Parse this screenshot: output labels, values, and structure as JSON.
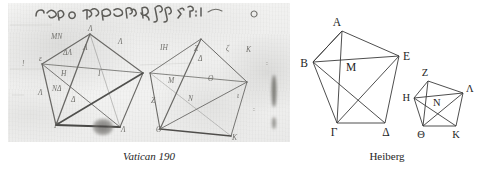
{
  "figure": {
    "panels": [
      {
        "id": "vatican",
        "caption": "Vatican 190",
        "caption_style": "italic",
        "kind": "manuscript-facsimile",
        "description": "Greek manuscript diagram: two overlapping pentagon figures with inscribed diagonals, faded brown ink on parchment, with a line of Greek minuscule text above"
      },
      {
        "id": "heiberg",
        "caption": "Heiberg",
        "caption_style": "roman",
        "kind": "printed-diagram",
        "description": "Two pentagons with all diagonals drawn, lettered in Greek capitals"
      }
    ]
  },
  "heiberg_diagram": {
    "large_pentagon": {
      "labels": [
        "Α",
        "Β",
        "Ε",
        "Γ",
        "Δ"
      ],
      "center_label": "Μ",
      "vertices": {
        "A": [
          342,
          31
        ],
        "B": [
          313,
          62
        ],
        "E": [
          399,
          56
        ],
        "G": [
          337,
          123
        ],
        "D": [
          385,
          123
        ],
        "M": [
          346,
          66
        ]
      }
    },
    "small_pentagon": {
      "labels": [
        "Ζ",
        "Η",
        "Λ",
        "Θ",
        "Κ"
      ],
      "center_label": "Ν",
      "vertices": {
        "Z": [
          428,
          81
        ],
        "H": [
          414,
          98
        ],
        "L": [
          463,
          93
        ],
        "TH": [
          423,
          126
        ],
        "K": [
          456,
          126
        ],
        "N": [
          437,
          100
        ]
      }
    },
    "stroke_color": "#3a3a3a",
    "label_color": "#1d1d1d"
  },
  "manuscript": {
    "ink_color": "#6b6b68",
    "parchment_color": "#efefee",
    "top_text_line": "γραμμοτωτεραν λς",
    "left_figure_labels": [
      "ΜΝ",
      "ΔΛ",
      "Λ",
      "Η",
      "ΝΔ",
      "Δ",
      "Γ",
      "Λ"
    ],
    "right_figure_labels": [
      "Ζ",
      "Δ",
      "Η",
      "Ν",
      "Κ",
      "Θ",
      "Ζ"
    ]
  }
}
